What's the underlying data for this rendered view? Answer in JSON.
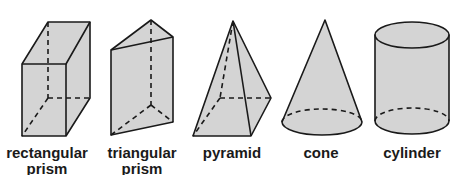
{
  "figure": {
    "fill_color": "#d4d4d4",
    "stroke_color": "#1a1a1a",
    "shapes": [
      {
        "id": "rectangular-prism",
        "label_line1": "rectangular",
        "label_line2": "prism"
      },
      {
        "id": "triangular-prism",
        "label_line1": "triangular",
        "label_line2": "prism"
      },
      {
        "id": "pyramid",
        "label_line1": "pyramid",
        "label_line2": ""
      },
      {
        "id": "cone",
        "label_line1": "cone",
        "label_line2": ""
      },
      {
        "id": "cylinder",
        "label_line1": "cylinder",
        "label_line2": ""
      }
    ]
  }
}
